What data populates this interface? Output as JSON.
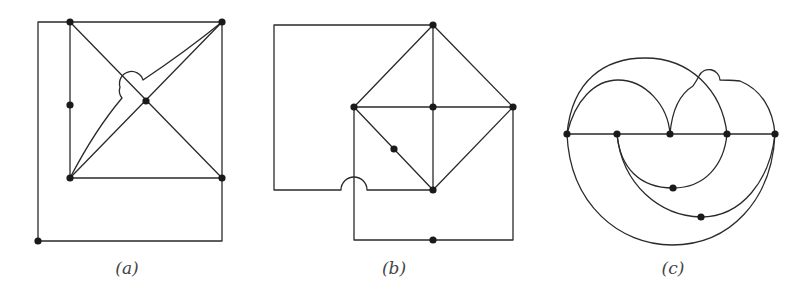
{
  "figure": {
    "panels": [
      {
        "id": "a",
        "caption": "(a)",
        "caption_x": 127,
        "nodes": [
          [
            70,
            22
          ],
          [
            222,
            22
          ],
          [
            70,
            105
          ],
          [
            146,
            101
          ],
          [
            70,
            178
          ],
          [
            222,
            178
          ],
          [
            38,
            241
          ]
        ],
        "paths": [
          "M38,241 L38,22 L70,22",
          "M70,22 L222,22",
          "M70,22 L70,178",
          "M222,22 L222,241 L38,241",
          "M70,178 L222,178",
          "M70,22 L222,178",
          "M70,178 L222,22",
          "M70,178 Q95,130 122,98 Q118,93 120,87 A12,12 0 0 1 143,80 Q185,52 222,22"
        ]
      },
      {
        "id": "b",
        "caption": "(b)",
        "caption_x": 394,
        "nodes": [
          [
            433,
            25
          ],
          [
            354,
            107
          ],
          [
            433,
            107
          ],
          [
            513,
            107
          ],
          [
            394,
            149
          ],
          [
            433,
            190
          ],
          [
            433,
            240
          ]
        ],
        "paths": [
          "M433,25 L274,25 L274,190 L341,190 A13,13 0 0 1 367,190 L433,190",
          "M433,25 L354,107",
          "M433,25 L513,107",
          "M433,25 L433,190",
          "M354,107 L513,107",
          "M354,107 L433,190",
          "M513,107 L433,190",
          "M354,107 L354,240 L513,240 L513,107"
        ]
      },
      {
        "id": "c",
        "caption": "(c)",
        "caption_x": 673,
        "nodes": [
          [
            567,
            134
          ],
          [
            617,
            134
          ],
          [
            670,
            134
          ],
          [
            727,
            134
          ],
          [
            775,
            134
          ],
          [
            673,
            188
          ],
          [
            701,
            217
          ]
        ],
        "paths": [
          "M567,134 L775,134",
          "M567,134 C572,80 605,58 645,58 C690,58 722,90 727,134",
          "M567,134 C575,100 595,80 618,80 C645,80 668,105 670,134",
          "M670,134 C672,110 680,94 693,86 Q697,80 699,76 A11,11 0 0 1 720,80 Q728,80 740,81 C762,90 773,110 775,134",
          "M617,134 C620,168 640,188 673,188 C705,188 724,165 727,134",
          "M617,134 C622,185 660,216 701,217 C742,217 770,180 775,134",
          "M567,134 C570,205 620,245 672,245 C730,245 772,200 775,134"
        ]
      }
    ],
    "style": {
      "stroke_color": "#2a2a2a",
      "node_color": "#1a1a1a",
      "node_radius": 3.6
    }
  }
}
